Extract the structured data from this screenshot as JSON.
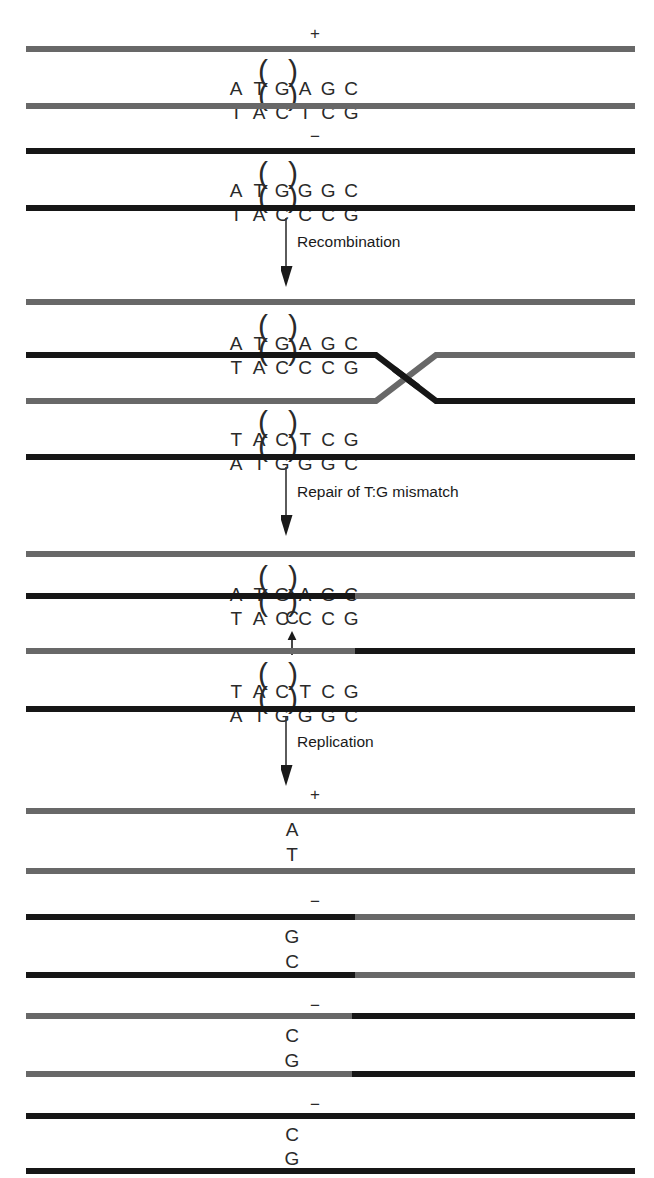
{
  "figure": {
    "colors": {
      "gray_strand": "#686868",
      "black_strand": "#161616",
      "text": "#2a2a2a"
    }
  },
  "steps": [
    {
      "id": "recombination",
      "label": "Recombination"
    },
    {
      "id": "repair",
      "label": "Repair of T:G mismatch"
    },
    {
      "id": "replication",
      "label": "Replication"
    }
  ],
  "stage1": {
    "name": "parental-duplexes",
    "duplexes": [
      {
        "allele": "+",
        "strand_colors": [
          "gray",
          "gray"
        ],
        "top_sequence": [
          "A",
          "T",
          "G",
          "A",
          "G",
          "C"
        ],
        "bottom_sequence": [
          "T",
          "A",
          "C",
          "T",
          "C",
          "G"
        ],
        "marked_index": 3
      },
      {
        "allele": "−",
        "strand_colors": [
          "black",
          "black"
        ],
        "top_sequence": [
          "A",
          "T",
          "G",
          "G",
          "G",
          "C"
        ],
        "bottom_sequence": [
          "T",
          "A",
          "C",
          "C",
          "C",
          "G"
        ],
        "marked_index": 3
      }
    ]
  },
  "stage2": {
    "name": "holliday-junction",
    "crossover_label": "strand-crossover",
    "upper_duplex": {
      "top_sequence": [
        "A",
        "T",
        "G",
        "A",
        "G",
        "C"
      ],
      "bottom_sequence": [
        "T",
        "A",
        "C",
        "C",
        "C",
        "G"
      ],
      "marked_index": 3
    },
    "lower_duplex": {
      "top_sequence": [
        "T",
        "A",
        "C",
        "T",
        "C",
        "G"
      ],
      "bottom_sequence": [
        "A",
        "T",
        "G",
        "G",
        "G",
        "C"
      ],
      "marked_index": 3
    }
  },
  "stage3": {
    "name": "mismatch-repaired",
    "upper_duplex": {
      "top_sequence": [
        "A",
        "T",
        "G",
        "A",
        "G",
        "C"
      ],
      "bottom_sequence": [
        "T",
        "A",
        "C",
        "C",
        "C",
        "G"
      ],
      "marked_index": 3
    },
    "lower_duplex": {
      "top_sequence": [
        "T",
        "A",
        "C",
        "T",
        "C",
        "G"
      ],
      "bottom_sequence": [
        "A",
        "T",
        "G",
        "G",
        "G",
        "C"
      ],
      "marked_index": 3
    },
    "repair_callout": {
      "base": "C",
      "arrow": "up"
    }
  },
  "stage4": {
    "name": "replication-products",
    "products": [
      {
        "allele": "+",
        "top_base": "A",
        "bottom_base": "T"
      },
      {
        "allele": "−",
        "top_base": "G",
        "bottom_base": "C"
      },
      {
        "allele": "−",
        "top_base": "C",
        "bottom_base": "G"
      },
      {
        "allele": "−",
        "top_base": "C",
        "bottom_base": "G"
      }
    ]
  }
}
